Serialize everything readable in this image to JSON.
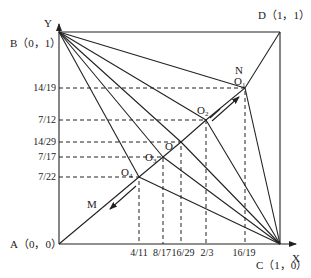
{
  "axes": {
    "x_label": "X",
    "y_label": "Y"
  },
  "corners": {
    "A": {
      "label": "A（0，0）",
      "x": 0,
      "y": 0
    },
    "B": {
      "label": "B（0，1）",
      "x": 0,
      "y": 1
    },
    "C": {
      "label": "C（1，0）",
      "x": 1,
      "y": 0
    },
    "D": {
      "label": "D（1，1）",
      "x": 1,
      "y": 1
    }
  },
  "points": [
    {
      "name": "O1",
      "base": "O",
      "sub": "1",
      "x": 0.8421,
      "y": 0.7368,
      "x_tick": "16/19",
      "y_tick": "14/19"
    },
    {
      "name": "O2",
      "base": "O",
      "sub": "2",
      "x": 0.6667,
      "y": 0.5833,
      "x_tick": "2/3",
      "y_tick": "7/12"
    },
    {
      "name": "O",
      "base": "O",
      "sub": "",
      "x": 0.5517,
      "y": 0.4828,
      "x_tick": "16/29",
      "y_tick": "14/29"
    },
    {
      "name": "O3",
      "base": "O",
      "sub": "3",
      "x": 0.4706,
      "y": 0.4118,
      "x_tick": "8/17",
      "y_tick": "7/17"
    },
    {
      "name": "O4",
      "base": "O",
      "sub": "4",
      "x": 0.3636,
      "y": 0.3182,
      "x_tick": "4/11",
      "y_tick": "7/22"
    }
  ],
  "x_ticks": [
    "4/11",
    "8/17",
    "16/29",
    "2/3",
    "16/19"
  ],
  "y_ticks": [
    "14/19",
    "7/12",
    "14/29",
    "7/17",
    "7/22"
  ],
  "path_labels": {
    "N": "N",
    "M": "M"
  },
  "colors": {
    "line": "#222222",
    "background": "#ffffff"
  }
}
